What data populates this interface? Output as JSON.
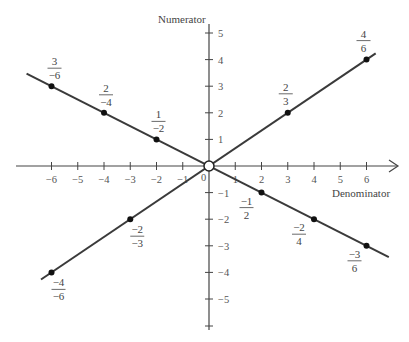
{
  "chart_data": {
    "type": "line",
    "title": "",
    "xlabel": "Denominator",
    "ylabel": "Numerator",
    "xlim": [
      -7,
      7
    ],
    "ylim": [
      -6,
      6
    ],
    "grid": false,
    "legend": null,
    "x_ticks": [
      -6,
      -5,
      -4,
      -3,
      -2,
      -1,
      0,
      1,
      2,
      3,
      4,
      5,
      6
    ],
    "y_ticks": [
      5,
      4,
      3,
      2,
      1,
      -1,
      -2,
      -3,
      -4,
      -5
    ],
    "origin_marker": "open-circle",
    "series": [
      {
        "name": "line of equivalent fractions -1/2",
        "slope": -0.5,
        "points": [
          {
            "x": -6,
            "y": 3,
            "num": "3",
            "den": "-6"
          },
          {
            "x": -4,
            "y": 2,
            "num": "2",
            "den": "-4"
          },
          {
            "x": -2,
            "y": 1,
            "num": "1",
            "den": "-2"
          },
          {
            "x": 2,
            "y": -1,
            "num": "-1",
            "den": "2"
          },
          {
            "x": 4,
            "y": -2,
            "num": "-2",
            "den": "4"
          },
          {
            "x": 6,
            "y": -3,
            "num": "-3",
            "den": "6"
          }
        ]
      },
      {
        "name": "line of equivalent fractions 2/3",
        "slope": 0.6667,
        "points": [
          {
            "x": -6,
            "y": -4,
            "num": "-4",
            "den": "-6"
          },
          {
            "x": -3,
            "y": -2,
            "num": "-2",
            "den": "-3"
          },
          {
            "x": 3,
            "y": 2,
            "num": "2",
            "den": "3"
          },
          {
            "x": 6,
            "y": 4,
            "num": "4",
            "den": "6"
          }
        ]
      }
    ]
  },
  "labels": {
    "x_axis_title": "Denominator",
    "y_axis_title": "Numerator",
    "origin_label": "0"
  }
}
